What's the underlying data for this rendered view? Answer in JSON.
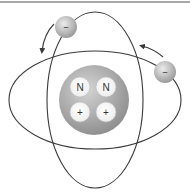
{
  "diagram": {
    "colors": {
      "border": "#8a8a8a",
      "orbit": "#3a3a3a",
      "nucleus_light": "#d0d0d0",
      "nucleus_dark": "#8f8f8f",
      "particle_fill": "#ffffff",
      "electron_light": "#e6e6e6",
      "electron_dark": "#9a9a9a"
    },
    "nucleus": {
      "particles": [
        {
          "type": "neutron",
          "label": "N"
        },
        {
          "type": "neutron",
          "label": "N"
        },
        {
          "type": "proton",
          "label": "+"
        },
        {
          "type": "proton",
          "label": "+"
        }
      ]
    },
    "electrons": [
      {
        "label": "–",
        "direction": "counter-clockwise"
      },
      {
        "label": "–",
        "direction": "counter-clockwise"
      }
    ],
    "orbits": [
      "vertical-orbit",
      "horizontal-orbit"
    ]
  }
}
